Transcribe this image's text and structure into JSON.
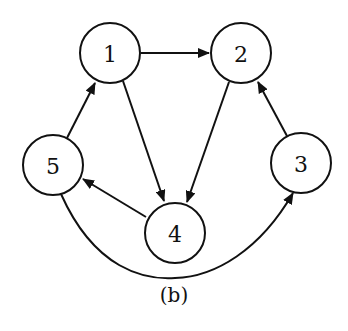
{
  "caption": "(b)",
  "colors": {
    "stroke": "#111111",
    "background": "#ffffff"
  },
  "nodes": [
    {
      "id": "1",
      "label": "1",
      "cx": 110,
      "cy": 53
    },
    {
      "id": "2",
      "label": "2",
      "cx": 241,
      "cy": 53
    },
    {
      "id": "3",
      "label": "3",
      "cx": 301,
      "cy": 163
    },
    {
      "id": "4",
      "label": "4",
      "cx": 175,
      "cy": 233
    },
    {
      "id": "5",
      "label": "5",
      "cx": 53,
      "cy": 165
    }
  ],
  "edges": [
    {
      "from": "1",
      "to": "2",
      "curved": false
    },
    {
      "from": "1",
      "to": "4",
      "curved": false
    },
    {
      "from": "2",
      "to": "4",
      "curved": false
    },
    {
      "from": "3",
      "to": "2",
      "curved": false
    },
    {
      "from": "4",
      "to": "5",
      "curved": false
    },
    {
      "from": "5",
      "to": "1",
      "curved": false
    },
    {
      "from": "5",
      "to": "3",
      "curved": true
    }
  ]
}
